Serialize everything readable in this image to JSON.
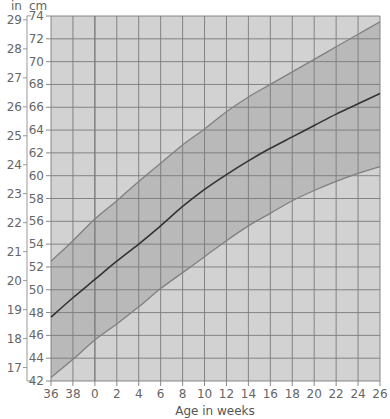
{
  "chart_data": {
    "type": "area",
    "title": "",
    "xlabel": "Age in weeks",
    "ylabel_left": "in",
    "ylabel_right": "cm",
    "x_ticks": [
      "36",
      "38",
      "0",
      "2",
      "4",
      "6",
      "8",
      "10",
      "12",
      "14",
      "16",
      "18",
      "20",
      "22",
      "24",
      "26"
    ],
    "x_note": "36 and 38 are gestational weeks before birth; 0-26 are weeks after birth",
    "cm_ticks": [
      42,
      44,
      46,
      48,
      50,
      52,
      54,
      56,
      58,
      60,
      62,
      64,
      66,
      68,
      70,
      72,
      74
    ],
    "inch_ticks": [
      17,
      18,
      19,
      20,
      21,
      22,
      23,
      24,
      25,
      26,
      27,
      28,
      29
    ],
    "ylim_cm": [
      42,
      74
    ],
    "grid": true,
    "series": [
      {
        "name": "upper",
        "values_cm": [
          52.5,
          54.3,
          56.2,
          57.8,
          59.5,
          61.1,
          62.7,
          64.1,
          65.6,
          66.9,
          68.0,
          69.1,
          70.2,
          71.3,
          72.4,
          73.5
        ]
      },
      {
        "name": "median",
        "values_cm": [
          47.6,
          49.3,
          50.9,
          52.5,
          54.0,
          55.6,
          57.3,
          58.8,
          60.1,
          61.3,
          62.4,
          63.4,
          64.4,
          65.4,
          66.3,
          67.2
        ]
      },
      {
        "name": "lower",
        "values_cm": [
          42.3,
          43.9,
          45.6,
          47.0,
          48.5,
          50.1,
          51.5,
          52.9,
          54.3,
          55.6,
          56.7,
          57.8,
          58.7,
          59.5,
          60.2,
          60.8
        ]
      }
    ],
    "colors": {
      "background": "#d2d2d2",
      "band": "#b9b9b9",
      "grid": "#7a7a7a",
      "median_line": "#333333",
      "boundary_line": "#808080"
    }
  }
}
